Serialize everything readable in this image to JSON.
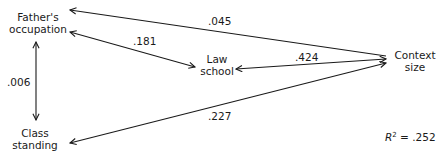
{
  "diagram": {
    "type": "path-diagram",
    "nodes": {
      "fathers_occupation": {
        "line1": "Father's",
        "line2": "occupation"
      },
      "law_school": {
        "line1": "Law",
        "line2": "school"
      },
      "context_size": {
        "line1": "Context",
        "line2": "size"
      },
      "class_standing": {
        "line1": "Class",
        "line2": "standing"
      }
    },
    "edges": [
      {
        "from": "context_size",
        "to": "fathers_occupation",
        "coefficient": ".045"
      },
      {
        "from": "fathers_occupation",
        "to": "law_school",
        "coefficient": ".181",
        "bidirectional": true
      },
      {
        "from": "context_size",
        "to": "law_school",
        "coefficient": ".424",
        "bidirectional": true
      },
      {
        "from": "fathers_occupation",
        "to": "class_standing",
        "coefficient": ".006",
        "bidirectional": true
      },
      {
        "from": "context_size",
        "to": "class_standing",
        "coefficient": ".227"
      }
    ],
    "r_squared": {
      "symbol": "R",
      "exponent": "2",
      "equals": " = ",
      "value": ".252"
    },
    "line_color": "#1a1a1a"
  }
}
